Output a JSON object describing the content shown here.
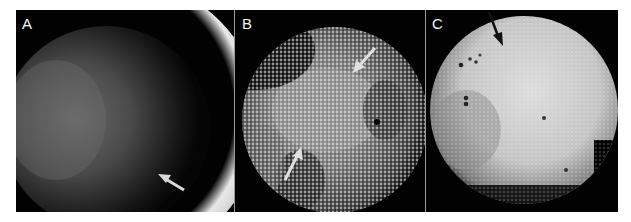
{
  "figure": {
    "panels": [
      {
        "id": "A",
        "label": "A",
        "description": "dark disc with bright crescent rim at upper right",
        "arrows": 1,
        "arrow_color": "#d8d8d8"
      },
      {
        "id": "B",
        "label": "B",
        "description": "halftone-dotted disc with bright lobes and dark gaps",
        "arrows": 2,
        "arrow_color": "#e0e0e0"
      },
      {
        "id": "C",
        "label": "C",
        "description": "bright halftone disc with dark specks",
        "arrows": 1,
        "arrow_color": "#111111"
      }
    ],
    "colors": {
      "background": "#000000",
      "frame": "#ffffff",
      "label": "#f2f2f2"
    }
  }
}
